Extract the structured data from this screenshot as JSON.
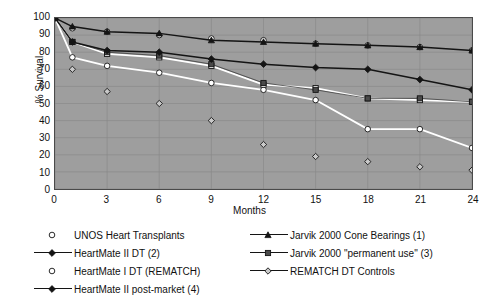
{
  "chart_data": {
    "type": "line",
    "title": "",
    "xlabel": "Months",
    "ylabel": "% Survival",
    "x": [
      0,
      1,
      3,
      6,
      9,
      12,
      15,
      18,
      21,
      24
    ],
    "xticks": [
      "0",
      "3",
      "6",
      "9",
      "12",
      "15",
      "18",
      "21",
      "24"
    ],
    "yticks": [
      "100",
      "90",
      "80",
      "70",
      "60",
      "50",
      "40",
      "30",
      "20",
      "10",
      "0"
    ],
    "xlim": [
      0,
      24
    ],
    "ylim": [
      0,
      100
    ],
    "grid": true,
    "legend_position": "bottom",
    "series": [
      {
        "name": "UNOS Heart Transplants",
        "marker": "open-circle",
        "color": "#ffffff",
        "line": "none",
        "x": [
          0,
          1,
          3,
          6,
          9,
          12,
          15,
          18,
          21,
          24
        ],
        "values": [
          100,
          94,
          92,
          90,
          88,
          87,
          85,
          84,
          83,
          81
        ]
      },
      {
        "name": "Jarvik 2000 Cone Bearings (1)",
        "marker": "filled-triangle",
        "color": "#1a1a1a",
        "line": "solid",
        "x": [
          0,
          1,
          3,
          6,
          9,
          12,
          15,
          18,
          21,
          24
        ],
        "values": [
          100,
          95,
          92,
          91,
          87,
          86,
          85,
          84,
          83,
          81
        ]
      },
      {
        "name": "HeartMate II DT (2)",
        "marker": "filled-diamond",
        "color": "#1a1a1a",
        "line": "solid",
        "x": [
          0,
          1,
          3,
          6,
          9,
          12,
          15,
          18,
          21,
          24
        ],
        "values": [
          100,
          86,
          81,
          80,
          76,
          73,
          71,
          70,
          64,
          58
        ]
      },
      {
        "name": "Jarvik 2000 \"permanent use\" (3)",
        "marker": "filled-square",
        "color": "#3a3a3a",
        "line": "thin-solid",
        "x": [
          0,
          1,
          3,
          6,
          9,
          12,
          15,
          18,
          21,
          24
        ],
        "values": [
          100,
          86,
          80,
          78,
          73,
          62,
          58,
          53,
          53,
          51
        ]
      },
      {
        "name": "HeartMate II  post-market (4)",
        "marker": "open-square",
        "color": "#ffffff",
        "line": "solid-white",
        "x": [
          0,
          1,
          3,
          6,
          9,
          12,
          15,
          18,
          21,
          24
        ],
        "values": [
          100,
          86,
          79,
          77,
          72,
          61,
          59,
          53,
          52,
          51
        ]
      },
      {
        "name": "HeartMate I DT (REMATCH)",
        "marker": "open-circle",
        "color": "#ffffff",
        "line": "solid-white",
        "x": [
          0,
          1,
          3,
          6,
          9,
          12,
          15,
          18,
          21,
          24
        ],
        "values": [
          100,
          77,
          72,
          68,
          62,
          58,
          52,
          35,
          35,
          24
        ]
      },
      {
        "name": "REMATCH DT Controls",
        "marker": "open-diamond",
        "color": "#9e9e9e",
        "line": "none",
        "x": [
          1,
          3,
          6,
          9,
          12,
          15,
          18,
          21,
          24
        ],
        "values": [
          70,
          57,
          50,
          40,
          26,
          19,
          16,
          13,
          11
        ]
      }
    ]
  },
  "axes": {
    "ylabel": "% Survival",
    "xlabel": "Months"
  },
  "legend": {
    "left_column": [
      {
        "label": "UNOS Heart Transplants",
        "marker": "open-circle",
        "line": "none"
      },
      {
        "label": "HeartMate II DT (2)",
        "marker": "filled-diamond",
        "line": "solid"
      },
      {
        "label": "HeartMate I DT (REMATCH)",
        "marker": "open-circle",
        "line": "none"
      },
      {
        "label": "HeartMate II  post-market (4)",
        "marker": "small-filled-diamond",
        "line": "solid"
      }
    ],
    "right_column": [
      {
        "label": "Jarvik 2000 Cone Bearings (1)",
        "marker": "filled-triangle",
        "line": "solid"
      },
      {
        "label": "Jarvik 2000 \"permanent use\" (3)",
        "marker": "filled-square",
        "line": "solid"
      },
      {
        "label": "REMATCH DT Controls",
        "marker": "open-diamond",
        "line": "solid"
      }
    ]
  },
  "colors": {
    "plot_background": "#9e9e9e",
    "axis": "#4a4a4a",
    "text": "#111111",
    "dark_series": "#1a1a1a",
    "light_series": "#ffffff"
  }
}
